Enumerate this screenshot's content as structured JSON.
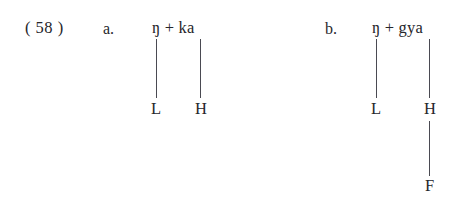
{
  "page": {
    "background_color": "#ffffff",
    "text_color": "#26262b",
    "line_color": "#4a4a52",
    "width": 468,
    "height": 199
  },
  "example": {
    "number_label": "( 58 )",
    "number": "58"
  },
  "items": [
    {
      "id": "a",
      "sub_label": "a.",
      "morphemes": "ŋ + ka",
      "segments": [
        "ŋ",
        "+",
        "ka"
      ],
      "tones": [
        {
          "label": "L",
          "linked_to": "ŋ"
        },
        {
          "label": "H",
          "linked_to": "ka"
        }
      ],
      "floating_tone": null,
      "association_lines": [
        {
          "from": "ŋ",
          "to": "L"
        },
        {
          "from": "ka",
          "to": "H"
        }
      ]
    },
    {
      "id": "b",
      "sub_label": "b.",
      "morphemes": "ŋ + gya",
      "segments": [
        "ŋ",
        "+",
        "gya"
      ],
      "tones": [
        {
          "label": "L",
          "linked_to": "ŋ"
        },
        {
          "label": "H",
          "linked_to": "gya"
        }
      ],
      "floating_tone": {
        "label": "F",
        "linked_to": "H"
      },
      "association_lines": [
        {
          "from": "ŋ",
          "to": "L"
        },
        {
          "from": "gya",
          "to": "H"
        },
        {
          "from": "H",
          "to": "F"
        }
      ]
    }
  ]
}
